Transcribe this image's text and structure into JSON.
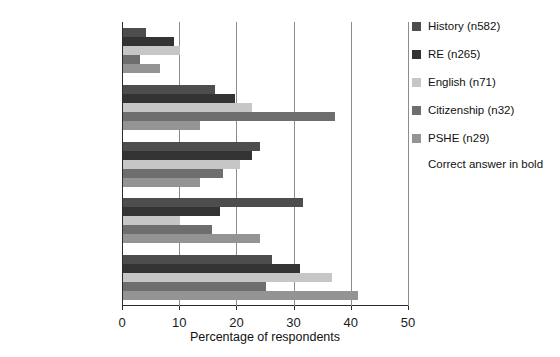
{
  "chart_data": {
    "type": "bar",
    "orientation": "horizontal",
    "title": "",
    "xlabel": "Percentage of respondents",
    "ylabel": "",
    "xlim": [
      0,
      50
    ],
    "xticks": [
      0,
      10,
      20,
      30,
      40,
      50
    ],
    "grid": "vertical gridlines at 10, 20, 30, 40",
    "legend_position": "right",
    "categories": [
      "more than 30%",
      "approximately 15%",
      "approximately 5%",
      "fewer than 1%",
      "not sure"
    ],
    "bold_category": "fewer than 1%",
    "annotation": "Correct answer in bold",
    "series": [
      {
        "name": "History (n582)",
        "color": "#4d4d4d",
        "values": [
          4.0,
          16.0,
          24.0,
          31.5,
          26.0
        ]
      },
      {
        "name": "RE (n265)",
        "color": "#333333",
        "values": [
          9.0,
          19.5,
          22.5,
          17.0,
          31.0
        ]
      },
      {
        "name": "English (n71)",
        "color": "#c6c6c6",
        "values": [
          10.0,
          22.5,
          20.5,
          10.0,
          36.5
        ]
      },
      {
        "name": "Citizenship (n32)",
        "color": "#6e6e6e",
        "values": [
          3.0,
          37.0,
          17.5,
          15.5,
          25.0
        ]
      },
      {
        "name": "PSHE (n29)",
        "color": "#949494",
        "values": [
          6.5,
          13.5,
          13.5,
          24.0,
          41.0
        ]
      }
    ]
  },
  "legend": {
    "note": "Correct answer in bold"
  },
  "axis": {
    "xlabel": "Percentage of respondents"
  }
}
